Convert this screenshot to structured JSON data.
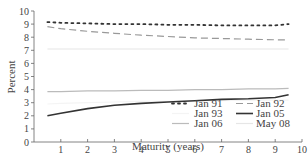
{
  "chart_data": {
    "type": "line",
    "title": "",
    "xlabel": "Maturity (years)",
    "ylabel": "Percent",
    "xlim": [
      0,
      10
    ],
    "ylim": [
      0,
      10
    ],
    "xticks": [
      1,
      2,
      3,
      4,
      5,
      6,
      7,
      8,
      9,
      10
    ],
    "yticks": [
      0,
      1,
      2,
      3,
      4,
      5,
      6,
      7,
      8,
      9,
      10
    ],
    "grid": false,
    "legend_position": "lower right",
    "x": [
      0.5,
      1,
      2,
      3,
      4,
      5,
      6,
      7,
      8,
      9,
      9.5
    ],
    "series": [
      {
        "name": "Jan 91",
        "style": "dotted",
        "color": "#333333",
        "values": [
          9.15,
          9.1,
          9.05,
          9.0,
          9.0,
          8.95,
          8.95,
          8.9,
          8.9,
          8.9,
          9.0
        ]
      },
      {
        "name": "Jan 92",
        "style": "dashed",
        "color": "#999999",
        "values": [
          8.8,
          8.65,
          8.45,
          8.3,
          8.15,
          8.05,
          7.95,
          7.9,
          7.85,
          7.8,
          7.8
        ]
      },
      {
        "name": "Jan 93",
        "style": "solid",
        "color": "#f4f4f4",
        "values": [
          2.9,
          2.95,
          3.0,
          3.05,
          3.1,
          3.1,
          3.15,
          3.15,
          3.2,
          3.2,
          3.2
        ]
      },
      {
        "name": "Jan 05",
        "style": "solid",
        "color": "#333333",
        "values": [
          2.0,
          2.2,
          2.55,
          2.8,
          2.95,
          3.05,
          3.15,
          3.25,
          3.3,
          3.4,
          3.6
        ]
      },
      {
        "name": "Jan 06",
        "style": "solid",
        "color": "#bbbbbb",
        "values": [
          3.85,
          3.85,
          3.9,
          3.9,
          3.95,
          3.95,
          4.0,
          4.0,
          4.05,
          4.05,
          4.1
        ]
      },
      {
        "name": "May 08",
        "style": "solid",
        "color": "#e6e6e6",
        "values": [
          7.1,
          7.1,
          7.1,
          7.1,
          7.1,
          7.1,
          7.1,
          7.1,
          7.1,
          7.1,
          7.1
        ]
      }
    ]
  }
}
